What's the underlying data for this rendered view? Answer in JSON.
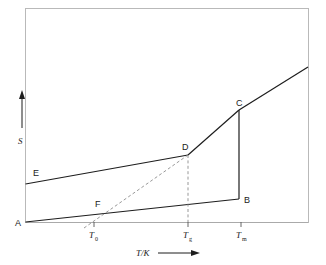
{
  "figure": {
    "domain": "thermodynamic-entropy-temperature-diagram",
    "background_color": "#ffffff",
    "line_color": "#1d1d1d",
    "dashed_color": "#8d8d8d",
    "frame_color": "#b9b9b9"
  },
  "axes": {
    "y_label": "S",
    "y_arrow": "up-arrow",
    "x_label": "T/K",
    "x_arrow": "right-arrow",
    "x_ticks": [
      {
        "id": "T0",
        "base": "T",
        "sub": "0",
        "x": 94
      },
      {
        "id": "Tg",
        "base": "T",
        "sub": "g",
        "x": 188
      },
      {
        "id": "Tm",
        "base": "T",
        "sub": "m",
        "x": 241
      }
    ]
  },
  "points": [
    {
      "id": "A",
      "label": "A",
      "x": 25,
      "y": 222,
      "label_x": 17,
      "label_y": 226
    },
    {
      "id": "B",
      "label": "B",
      "x": 239,
      "y": 199,
      "label_x": 243,
      "label_y": 202
    },
    {
      "id": "C",
      "label": "C",
      "x": 239,
      "y": 110,
      "label_x": 237,
      "label_y": 106
    },
    {
      "id": "D",
      "label": "D",
      "x": 188,
      "y": 155,
      "label_x": 183,
      "label_y": 149
    },
    {
      "id": "E",
      "label": "E",
      "x": 27,
      "y": 184,
      "label_x": 33,
      "label_y": 175
    },
    {
      "id": "F",
      "label": "F",
      "x": 100,
      "y": 211,
      "label_x": 96,
      "label_y": 205
    }
  ],
  "curves": {
    "crystal_branch": "A to B: lower solid line from origin rising slightly to B",
    "melt_branch": "B to C: vertical solid segment (entropy of fusion)",
    "liquid_branch": "C upward-right to the right frame edge",
    "glass_branch": "D to C: solid line through the supercooled liquid region",
    "glass_line": "E to D: upper solid line from left frame edge to D",
    "extrapolation": "dashed line from below-left through F to D",
    "drop_line": "vertical dashed line from D down to the T axis at Tg"
  }
}
